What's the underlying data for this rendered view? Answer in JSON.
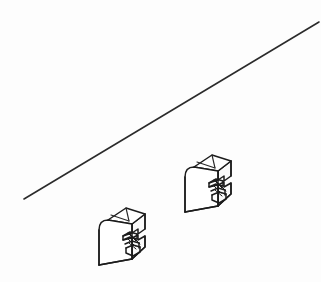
{
  "image": {
    "kind": "technical-line-drawing",
    "title": "Isometric bracket parts with diagonal reference line",
    "width": 321,
    "height": 282,
    "background_color": "#fdfdfd",
    "stroke_color": "#1c1c1c",
    "fill_color": "#ffffff"
  },
  "diagonal_line": {
    "label": "diagonal reference line",
    "x1": 24,
    "y1": 199,
    "x2": 319,
    "y2": 22,
    "stroke_color": "#2b2b2b",
    "stroke_width": 1.6
  },
  "parts": [
    {
      "id": "part-left",
      "label": "bracket part left",
      "origin_x": 92,
      "origin_y": 203,
      "scale": 1.0
    },
    {
      "id": "part-right",
      "label": "bracket part right",
      "origin_x": 178,
      "origin_y": 150,
      "scale": 1.0
    }
  ],
  "part_geometry": {
    "description": "isometric block with rounded left face and stepped notch on right side",
    "front_face": "M 8 28 L 8 62 L 44 62 L 44 22 L 30 22 L 18 18 Q 8 20 8 28 Z",
    "top_face": "M 18 18 L 38 6 L 58 12 L 44 22 Z",
    "right_face": "M 44 22 L 58 12 L 58 48 L 44 62 Z",
    "notch_steps": 4,
    "hatch_count": 5
  }
}
